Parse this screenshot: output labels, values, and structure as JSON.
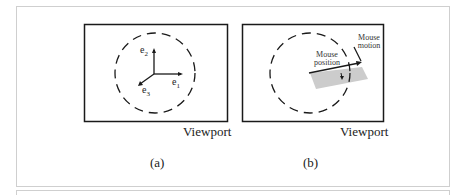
{
  "panels": [
    {
      "id": "a",
      "caption": "(a)",
      "viewport_label": "Viewport",
      "axes": {
        "e1": {
          "base": "e",
          "sub": "1"
        },
        "e2": {
          "base": "e",
          "sub": "2"
        },
        "e3": {
          "base": "e",
          "sub": "3"
        }
      }
    },
    {
      "id": "b",
      "caption": "(b)",
      "viewport_label": "Viewport",
      "annotations": {
        "mouse_position": [
          "Mouse",
          "position"
        ],
        "mouse_motion": [
          "Mouse",
          "motion"
        ]
      }
    }
  ],
  "colors": {
    "line": "#1a1a1a",
    "frame": "#cfcfcf",
    "shaded_plane": "#cccccc"
  }
}
